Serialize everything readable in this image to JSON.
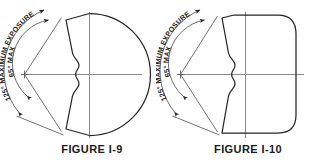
{
  "document": {
    "type": "technical-drawing-sheet",
    "background_color": "#ffffff",
    "line_color": "#262626",
    "centerline_color": "#808080",
    "width": 312,
    "height": 166
  },
  "figures": [
    {
      "id": "figure-i-9",
      "caption": "FIGURE I-9",
      "outline_shape": "circle",
      "angle_labels": {
        "outer": "125° MAXIMUM EXPOSURE",
        "inner": "65° MAX"
      },
      "annotations": {
        "outer_arc_degrees": 125,
        "inner_arc_degrees": 65,
        "arc_arrow_style": "double-ended",
        "center_feature": "s-curve-notch",
        "centerlines": [
          "horizontal",
          "vertical"
        ]
      }
    },
    {
      "id": "figure-i-10",
      "caption": "FIGURE I-10",
      "outline_shape": "rounded-rectangle",
      "angle_labels": {
        "outer": "125° MAXIMUM EXPOSURE",
        "inner": "65° MAX"
      },
      "annotations": {
        "outer_arc_degrees": 125,
        "inner_arc_degrees": 65,
        "arc_arrow_style": "double-ended",
        "center_feature": "s-curve-notch",
        "centerlines": [
          "horizontal",
          "vertical"
        ]
      }
    }
  ]
}
